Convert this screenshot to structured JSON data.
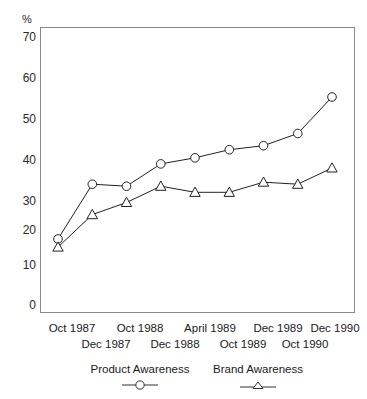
{
  "chart_data": {
    "type": "line",
    "title": "",
    "xlabel": "",
    "ylabel": "%",
    "ylim": [
      0,
      70
    ],
    "yticks": [
      0,
      10,
      20,
      30,
      40,
      50,
      60,
      70
    ],
    "grid": false,
    "legend_position": "below-axis",
    "categories": [
      "Oct 1987",
      "Dec 1987",
      "Oct 1988",
      "Dec 1988",
      "April 1989",
      "Oct 1989",
      "Dec 1989",
      "Oct 1990",
      "Dec 1990"
    ],
    "series": [
      {
        "name": "Product Awareness",
        "marker": "circle",
        "line_style": "solid",
        "color": "#222222",
        "values": [
          18,
          31.5,
          31,
          36.5,
          38,
          40,
          41,
          44,
          53
        ]
      },
      {
        "name": "Brand Awareness",
        "marker": "triangle",
        "line_style": "solid",
        "color": "#222222",
        "values": [
          16,
          24,
          27,
          31,
          29.5,
          29.5,
          32,
          31.5,
          35.5
        ]
      }
    ]
  },
  "axis": {
    "y_unit_label": "%",
    "y_tick_labels": [
      "70",
      "60",
      "50",
      "40",
      "30",
      "20",
      "10",
      "0"
    ]
  },
  "x_axis_rows": {
    "top_row": [
      "Oct 1987",
      "Oct 1988",
      "April 1989",
      "Dec 1989",
      "Dec 1990"
    ],
    "bottom_row": [
      "Dec 1987",
      "Dec 1988",
      "Oct 1989",
      "Oct 1990"
    ]
  },
  "legend": {
    "entries": [
      {
        "label": "Product Awareness",
        "marker": "circle-marker"
      },
      {
        "label": "Brand Awareness",
        "marker": "triangle-marker"
      }
    ]
  }
}
